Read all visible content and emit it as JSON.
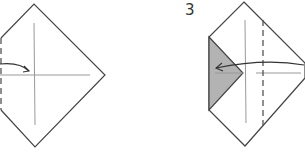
{
  "diagram": {
    "type": "origami-fold-instructions",
    "steps": [
      {
        "id": "step-2",
        "label": "",
        "description": "Square paper in diamond orientation with center crease lines; left corner folded to a dashed valley line; arrow indicates fold toward center"
      },
      {
        "id": "step-3",
        "label": "3",
        "description": "Left corner folded in (shaded flap); dashed valley line right of center; arrow indicates folding the right corner over to the left"
      }
    ],
    "colors": {
      "line": "#444444",
      "crease": "#888888",
      "shaded_flap": "#b3b3b3",
      "paper": "#ffffff"
    }
  }
}
